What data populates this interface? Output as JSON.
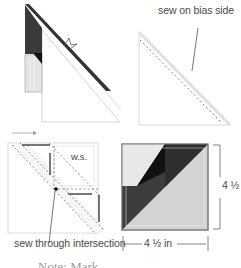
{
  "diagram": {
    "steps": [
      {
        "id": "step1",
        "description": "strip sewn to triangle with ruler marker"
      },
      {
        "id": "step2",
        "label": "sew on bias side"
      },
      {
        "id": "step3",
        "label_ws": "w.s.",
        "label_sew": "sew through intersection"
      },
      {
        "id": "step4",
        "width_label": "4 ½ in",
        "height_label": "4 ½ in"
      }
    ],
    "note_partial": "Note: Mark ..."
  },
  "colors": {
    "dark": "#2b2b2b",
    "mid_dark": "#3d3d3d",
    "light": "#d8d8d8",
    "lighter": "#e6e6e6",
    "outline": "#c8c8c8",
    "text": "#4a4a4a"
  }
}
